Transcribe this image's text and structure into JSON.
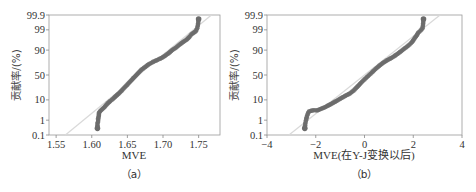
{
  "chart_data": [
    {
      "type": "scatter",
      "subtype": "normal-probability-plot",
      "caption": "（a）",
      "xlabel": "MVE",
      "ylabel": "贡献率/(%)",
      "xlim": [
        1.54,
        1.78
      ],
      "x_ticks": [
        1.55,
        1.6,
        1.65,
        1.7,
        1.75
      ],
      "x_tick_labels": [
        "1.55",
        "1.60",
        "1.65",
        "1.70",
        "1.75"
      ],
      "y_ticks": [
        0.1,
        1,
        10,
        50,
        90,
        99,
        99.9
      ],
      "y_tick_labels": [
        "0.1",
        "1",
        "10",
        "50",
        "90",
        "99",
        "99.9"
      ],
      "ylim": [
        0.1,
        99.9
      ],
      "reference_line": {
        "x": [
          1.563,
          1.768
        ],
        "y": [
          0.1,
          99.9
        ]
      },
      "points": [
        [
          1.608,
          0.3
        ],
        [
          1.608,
          0.6
        ],
        [
          1.609,
          0.9
        ],
        [
          1.609,
          1.3
        ],
        [
          1.61,
          1.8
        ],
        [
          1.61,
          2.5
        ],
        [
          1.612,
          3.2
        ],
        [
          1.615,
          4.0
        ],
        [
          1.618,
          5.0
        ],
        [
          1.622,
          7
        ],
        [
          1.626,
          9
        ],
        [
          1.63,
          11
        ],
        [
          1.634,
          14
        ],
        [
          1.638,
          17
        ],
        [
          1.642,
          21
        ],
        [
          1.646,
          26
        ],
        [
          1.65,
          31
        ],
        [
          1.654,
          37
        ],
        [
          1.658,
          43
        ],
        [
          1.662,
          49
        ],
        [
          1.666,
          55
        ],
        [
          1.67,
          61
        ],
        [
          1.675,
          66
        ],
        [
          1.68,
          71
        ],
        [
          1.686,
          75
        ],
        [
          1.692,
          78
        ],
        [
          1.698,
          81
        ],
        [
          1.703,
          84
        ],
        [
          1.708,
          87
        ],
        [
          1.713,
          90
        ],
        [
          1.718,
          92
        ],
        [
          1.723,
          94
        ],
        [
          1.728,
          95.5
        ],
        [
          1.733,
          96.5
        ],
        [
          1.737,
          97.5
        ],
        [
          1.74,
          98.2
        ],
        [
          1.746,
          98.8
        ],
        [
          1.748,
          99.2
        ],
        [
          1.749,
          99.5
        ],
        [
          1.75,
          99.8
        ]
      ]
    },
    {
      "type": "scatter",
      "subtype": "normal-probability-plot",
      "caption": "（b）",
      "xlabel": "MVE(在Y-J变换以后)",
      "ylabel": "贡献率/(%)",
      "xlim": [
        -4,
        4
      ],
      "x_ticks": [
        -4,
        -2,
        0,
        2,
        4
      ],
      "x_tick_labels": [
        "−4",
        "−2",
        "0",
        "2",
        "4"
      ],
      "y_ticks": [
        0.1,
        1,
        10,
        50,
        90,
        99,
        99.9
      ],
      "y_tick_labels": [
        "0.1",
        "1",
        "10",
        "50",
        "90",
        "99",
        "99.9"
      ],
      "ylim": [
        0.1,
        99.9
      ],
      "reference_line": {
        "x": [
          -3.1,
          3.1
        ],
        "y": [
          0.1,
          99.9
        ]
      },
      "points": [
        [
          -2.45,
          0.3
        ],
        [
          -2.43,
          0.6
        ],
        [
          -2.4,
          1.0
        ],
        [
          -2.37,
          1.5
        ],
        [
          -2.33,
          2.2
        ],
        [
          -2.28,
          3.0
        ],
        [
          -2.1,
          3.5
        ],
        [
          -1.95,
          3.4
        ],
        [
          -1.8,
          4.0
        ],
        [
          -1.6,
          5.0
        ],
        [
          -1.4,
          6.5
        ],
        [
          -1.2,
          8.5
        ],
        [
          -1.0,
          11
        ],
        [
          -0.8,
          14
        ],
        [
          -0.6,
          17
        ],
        [
          -0.45,
          21
        ],
        [
          -0.3,
          27
        ],
        [
          -0.15,
          34
        ],
        [
          0.0,
          41
        ],
        [
          0.15,
          48
        ],
        [
          0.3,
          55
        ],
        [
          0.45,
          62
        ],
        [
          0.6,
          68
        ],
        [
          0.75,
          73
        ],
        [
          0.9,
          77
        ],
        [
          1.05,
          80
        ],
        [
          1.2,
          83
        ],
        [
          1.35,
          86
        ],
        [
          1.5,
          89
        ],
        [
          1.65,
          91.5
        ],
        [
          1.8,
          93.5
        ],
        [
          1.95,
          95.5
        ],
        [
          2.05,
          97
        ],
        [
          2.15,
          98
        ],
        [
          2.2,
          98.5
        ],
        [
          2.3,
          98.9
        ],
        [
          2.38,
          99.2
        ],
        [
          2.4,
          99.5
        ],
        [
          2.42,
          99.8
        ]
      ]
    }
  ],
  "style": {
    "point_color": "#6b6b6b",
    "ref_line_color": "#d9d9d9",
    "axis_color": "#888888"
  }
}
